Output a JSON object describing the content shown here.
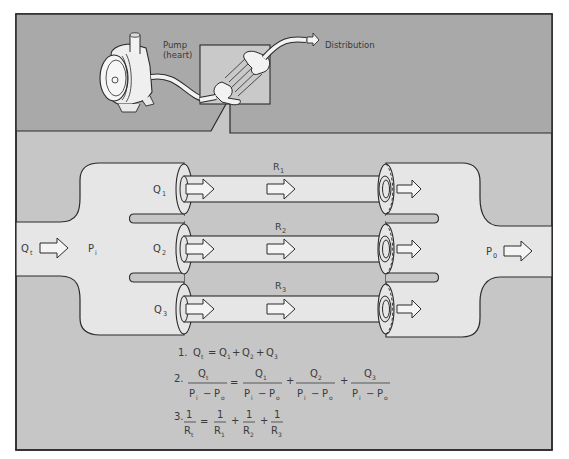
{
  "colors": {
    "top_panel": "#a9a9a9",
    "bottom_panel": "#c6c6c6",
    "tube_fill": "#e6e6e6",
    "inset_fill": "#c9c9c9",
    "stroke": "#2a2a2a",
    "arrow_fill": "#f4f4f4",
    "text": "#3a3a3a"
  },
  "top": {
    "pump_label_line1": "Pump",
    "pump_label_line2": "(heart)",
    "distribution_label": "Distribution"
  },
  "inlet": {
    "flow_label": "Q",
    "flow_sub": "t",
    "pressure_label": "P",
    "pressure_sub": "i"
  },
  "outlet": {
    "pressure_label": "P",
    "pressure_sub": "0"
  },
  "branches": [
    {
      "flow_label": "Q",
      "flow_sub": "1",
      "resistance_label": "R",
      "resistance_sub": "1"
    },
    {
      "flow_label": "Q",
      "flow_sub": "2",
      "resistance_label": "R",
      "resistance_sub": "2"
    },
    {
      "flow_label": "Q",
      "flow_sub": "3",
      "resistance_label": "R",
      "resistance_sub": "3"
    }
  ],
  "equations": {
    "eq1": {
      "number": "1.",
      "lhs": "Q",
      "lhs_sub": "t",
      "equals": "=",
      "terms": [
        {
          "sym": "Q",
          "sub": "1"
        },
        {
          "sym": "Q",
          "sub": "2"
        },
        {
          "sym": "Q",
          "sub": "3"
        }
      ],
      "plus": "+"
    },
    "eq2": {
      "number": "2.",
      "lhs_num": "Q",
      "lhs_num_sub": "t",
      "den_a": "P",
      "den_a_sub": "i",
      "minus": "−",
      "den_b": "P",
      "den_b_sub": "o",
      "equals": "=",
      "plus": "+",
      "terms": [
        {
          "num": "Q",
          "num_sub": "1"
        },
        {
          "num": "Q",
          "num_sub": "2"
        },
        {
          "num": "Q",
          "num_sub": "3"
        }
      ]
    },
    "eq3": {
      "number": "3.",
      "one": "1",
      "lhs_den": "R",
      "lhs_den_sub": "t",
      "equals": "=",
      "plus": "+",
      "terms": [
        {
          "den": "R",
          "den_sub": "1"
        },
        {
          "den": "R",
          "den_sub": "2"
        },
        {
          "den": "R",
          "den_sub": "3"
        }
      ]
    }
  }
}
